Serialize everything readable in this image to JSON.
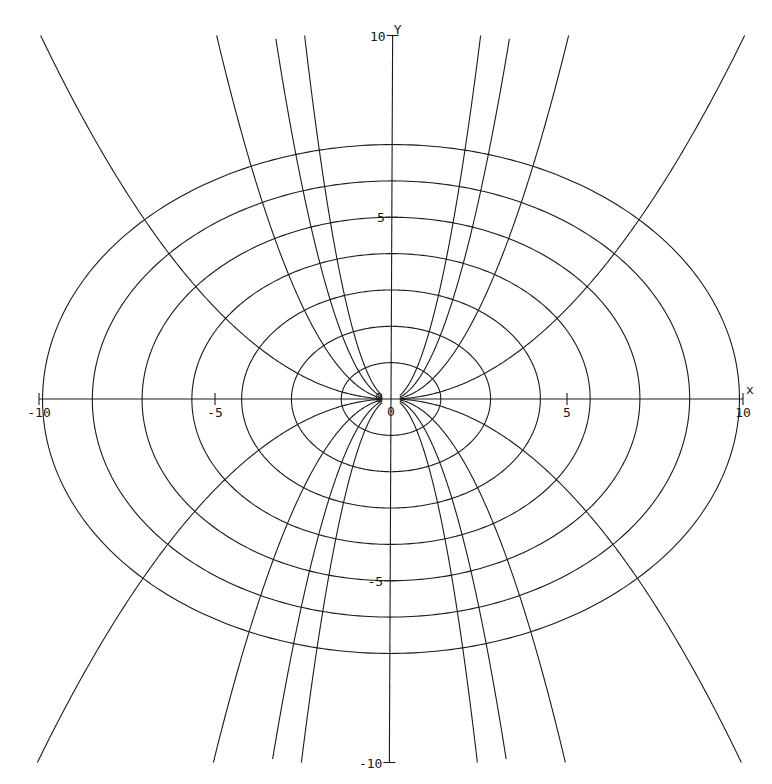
{
  "chart_data": {
    "type": "line",
    "title": "",
    "xlabel": "x",
    "ylabel": "Y",
    "xlim": [
      -10,
      10
    ],
    "ylim": [
      -10,
      10
    ],
    "grid": false,
    "legend": null,
    "x_ticks": [
      -10,
      -5,
      0,
      5,
      10
    ],
    "y_ticks": [
      -10,
      -5,
      0,
      5,
      10
    ],
    "x_tick_labels": [
      "-10",
      "-5",
      "0",
      "5",
      "10"
    ],
    "y_tick_labels": [
      "-10",
      "-5",
      "0",
      "5",
      "10"
    ],
    "series": [
      {
        "name": "ellipse x^2/2 + y^2 = 1",
        "family": "ellipse",
        "n": 1,
        "a": 1.414,
        "b": 1
      },
      {
        "name": "ellipse x^2/2 + y^2 = 4",
        "family": "ellipse",
        "n": 2,
        "a": 2.828,
        "b": 2
      },
      {
        "name": "ellipse x^2/2 + y^2 = 9",
        "family": "ellipse",
        "n": 3,
        "a": 4.243,
        "b": 3
      },
      {
        "name": "ellipse x^2/2 + y^2 = 16",
        "family": "ellipse",
        "n": 4,
        "a": 5.657,
        "b": 4
      },
      {
        "name": "ellipse x^2/2 + y^2 = 25",
        "family": "ellipse",
        "n": 5,
        "a": 7.071,
        "b": 5
      },
      {
        "name": "ellipse x^2/2 + y^2 = 36",
        "family": "ellipse",
        "n": 6,
        "a": 8.485,
        "b": 6
      },
      {
        "name": "ellipse x^2/2 + y^2 = 49",
        "family": "ellipse",
        "n": 7,
        "a": 9.899,
        "b": 7
      },
      {
        "name": "parabola y = 0.1x^2",
        "family": "parabola",
        "k": 0.1,
        "sign": 1
      },
      {
        "name": "parabola y = 0.4x^2",
        "family": "parabola",
        "k": 0.4,
        "sign": 1
      },
      {
        "name": "parabola y = 0.9x^2",
        "family": "parabola",
        "k": 0.9,
        "sign": 1
      },
      {
        "name": "parabola y = 1.6x^2",
        "family": "parabola",
        "k": 1.6,
        "sign": 1
      },
      {
        "name": "parabola y = -0.1x^2",
        "family": "parabola",
        "k": 0.1,
        "sign": -1
      },
      {
        "name": "parabola y = -0.4x^2",
        "family": "parabola",
        "k": 0.4,
        "sign": -1
      },
      {
        "name": "parabola y = -0.9x^2",
        "family": "parabola",
        "k": 0.9,
        "sign": -1
      },
      {
        "name": "parabola y = -1.6x^2",
        "family": "parabola",
        "k": 1.6,
        "sign": -1
      }
    ],
    "annotations": [
      "0",
      "0"
    ]
  },
  "axes": {
    "x_axis_label": "x",
    "y_axis_label": "Y",
    "origin_label_x": "0",
    "origin_label_y": "0"
  },
  "layout": {
    "origin_px": [
      391,
      399
    ],
    "scale_px": [
      35.2,
      36.35
    ],
    "shear": -0.0045
  }
}
